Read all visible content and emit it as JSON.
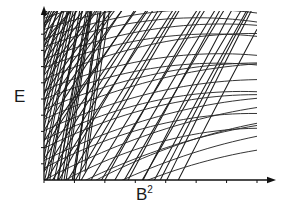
{
  "figure": {
    "kind": "landau-level-fan-diagram",
    "background_color": "#ffffff",
    "ink_color": "#1c1c1c"
  },
  "axes": {
    "y": {
      "label": "E",
      "label_name": "energy",
      "origin_px": [
        44,
        180
      ],
      "top_px": [
        44,
        6
      ],
      "tick_count": 9,
      "tick_side": "left",
      "tick_length_px": 3,
      "arrow": true
    },
    "x": {
      "label": "B",
      "label_superscript": "2",
      "label_full": "B²",
      "label_name": "magnetic-field-squared",
      "origin_px": [
        44,
        180
      ],
      "right_px": [
        276,
        180
      ],
      "tick_count": 7,
      "tick_side": "below",
      "tick_length_px": 3,
      "arrow": true
    }
  },
  "plot_area": {
    "left": 44,
    "right": 257,
    "top": 11,
    "bottom": 180
  },
  "chart_data": {
    "type": "line",
    "title": "",
    "subtitle": "",
    "xlabel": "B²",
    "ylabel": "E",
    "xlim": [
      0,
      1
    ],
    "ylim": [
      0,
      1
    ],
    "grid": false,
    "legend": null,
    "annotations": [],
    "xtick_labels": [],
    "ytick_labels": [],
    "series": [
      {
        "name": "family-a-steep-rising",
        "note": "Steeply rising, nearly straight branches fanning from the left axis and from the B-squared axis.",
        "count": 46,
        "slope_range": [
          1.15,
          2.6
        ],
        "curvature": -0.12,
        "y_intercepts": [
          -1.62,
          -1.5,
          -1.38,
          -1.27,
          -1.16,
          -1.05,
          -0.95,
          -0.85,
          -0.75,
          -0.66,
          -0.57,
          -0.48,
          -0.4,
          -0.32,
          -0.24,
          -0.16,
          -0.09,
          -0.02,
          0.05,
          0.12,
          0.18,
          0.24,
          0.3,
          0.36,
          0.42,
          0.47,
          0.52,
          0.57,
          0.62,
          0.67,
          0.71,
          0.75,
          0.79,
          0.83,
          0.87,
          0.9,
          0.93,
          0.96,
          0.99,
          1.02,
          1.05,
          1.08,
          1.11,
          1.14,
          1.17,
          1.2
        ]
      },
      {
        "name": "family-b-shallow-bowed",
        "note": "Shallower, downward-bowed branches sweeping left to right with mild concavity.",
        "count": 30,
        "slope_range": [
          0.3,
          0.78
        ],
        "curvature": -0.3,
        "y_intercepts": [
          -0.3,
          -0.24,
          -0.18,
          -0.12,
          -0.06,
          0.0,
          0.06,
          0.12,
          0.18,
          0.24,
          0.3,
          0.36,
          0.42,
          0.48,
          0.54,
          0.6,
          0.66,
          0.72,
          0.78,
          0.84,
          0.9,
          0.96,
          1.02,
          1.08,
          1.14,
          1.2,
          1.26,
          1.32,
          1.38,
          1.44
        ]
      },
      {
        "name": "family-c-dense-near-origin",
        "note": "Very steep short branches crowding the low-B-squared region near the origin.",
        "count": 34,
        "slope_range": [
          2.4,
          9.0
        ],
        "curvature": -0.05,
        "y_intercepts": [
          -1.7,
          -1.55,
          -1.4,
          -1.26,
          -1.12,
          -0.99,
          -0.86,
          -0.74,
          -0.62,
          -0.51,
          -0.4,
          -0.3,
          -0.2,
          -0.11,
          -0.02,
          0.06,
          0.14,
          0.22,
          0.3,
          0.37,
          0.44,
          0.5,
          0.56,
          0.62,
          0.68,
          0.73,
          0.78,
          0.83,
          0.88,
          0.92,
          0.96,
          1.0,
          1.04,
          1.08
        ]
      }
    ]
  }
}
